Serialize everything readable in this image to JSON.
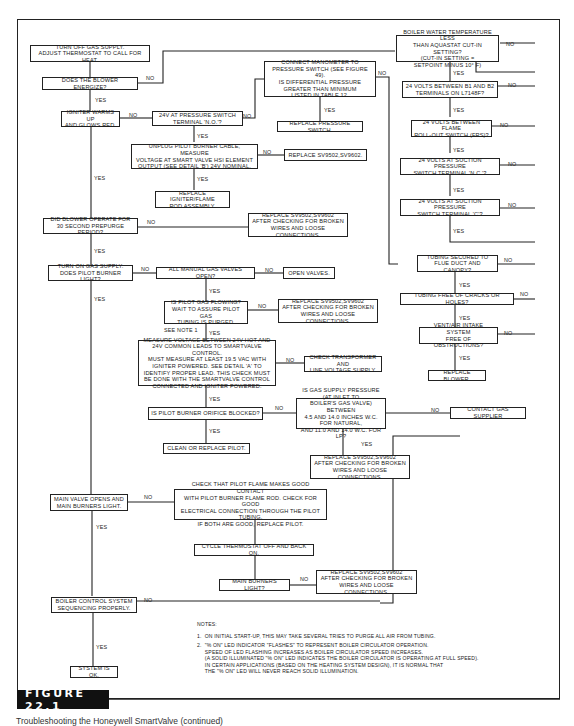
{
  "figure": {
    "label": "FIGURE 22.1",
    "caption": "Troubleshooting the Honeywell SmartValve (continued)"
  },
  "labels": {
    "yes": "YES",
    "no": "NO",
    "see_note_1": "SEE NOTE 1"
  },
  "boxes": {
    "turn_off_gas": "TURN OFF GAS SUPPLY.\nADJUST THERMOSTAT TO CALL FOR HEAT.",
    "blower_energize": "DOES THE BLOWER ENERGIZE?",
    "igniter_warms": "IGNITER WARMS UP\nAND GLOWS RED.",
    "v24_pressure_switch": "24V AT PRESSURE SWITCH\nTERMINAL 'N.O.'?",
    "connect_manometer": "CONNECT MANOMETER TO\nPRESSURE SWITCH (SEE FIGURE 49).\nIS DIFFERENTIAL PRESSURE\nGREATER THAN MINIMUM\nLISTED IN TABLE 12.",
    "replace_pressure_switch": "REPLACE PRESSURE SWITCH.",
    "unplug_pilot": "UNPLUG PILOT BURNER CABLE, MEASURE\nVOLTAGE AT SMART VALVE HSI ELEMENT\nOUTPUT (SEE DETAIL 'B') 24V NOMINAL.",
    "replace_sv_1": "REPLACE SV9502,SV9602.",
    "replace_igniter": "REPLACE IGNITER/FLAME\nROD ASSEMBLY.",
    "blower_prepurge": "DID BLOWER OPERATE FOR\n30 SECOND PREPURGE PERIOD?",
    "replace_sv_2": "REPLACE SV9502,SV9602\nAFTER CHECKING FOR BROKEN\nWIRES AND LOOSE CONNECTIONS.",
    "turn_on_gas": "TURN ON GAS SUPPLY.\nDOES PILOT BURNER LIGHT?",
    "manual_valves": "ALL MANUAL GAS VALVES OPEN?",
    "open_valves": "OPEN VALVES.",
    "pilot_gas_flowing": "IS PILOT GAS FLOWING?\nWAIT TO ASSURE PILOT GAS\nTUBING IS PURGED.",
    "replace_sv_3": "REPLACE SV9502,SV9602\nAFTER CHECKING FOR BROKEN\nWIRES AND LOOSE CONNECTIONS.",
    "measure_voltage": "MEASURE VOLTAGE BETWEEN 24V HOT AND\n24V COMMON LEADS TO SMARTVALVE CONTROL.\nMUST MEASURE AT LEAST 19.5 VAC WITH\nIGNITER POWERED. SEE DETAIL 'A' TO\nIDENTIFY PROPER LEAD. THIS CHECK MUST\nBE DONE WITH THE SMARTVALVE CONTROL\nCONNECTED AND IGNITER POWERED.",
    "check_transformer": "CHECK TRANSFORMER AND\nLINE VOLTAGE SUPPLY.",
    "orifice_blocked": "IS PILOT BURNER ORIFICE BLOCKED?",
    "gas_supply_pressure": "IS GAS SUPPLY PRESSURE (AT INLET TO\nBOILER'S GAS VALVE) BETWEEN\n4.5 AND 14.0 INCHES W.C. FOR NATURAL,\nAND 11.0 AND 14.0 W.C. FOR LP?",
    "contact_supplier": "CONTACT GAS SUPPLIER",
    "clean_pilot": "CLEAN OR REPLACE PILOT.",
    "replace_sv_4": "REPLACE SV9502,SV9602\nAFTER CHECKING FOR BROKEN\nWIRES AND LOOSE CONNECTIONS.",
    "main_valve_opens": "MAIN VALVE OPENS AND\nMAIN BURNERS LIGHT.",
    "check_pilot_flame": "CHECK THAT PILOT FLAME MAKES GOOD CONTACT\nWITH PILOT BURNER FLAME ROD. CHECK FOR GOOD\nELECTRICAL CONNECTION THROUGH THE PILOT TUBING.\nIF BOTH ARE GOOD, REPLACE PILOT.",
    "cycle_thermostat": "CYCLE THERMOSTAT OFF AND BACK ON.",
    "main_burners_light": "MAIN BURNERS LIGHT?",
    "replace_sv_5": "REPLACE SV9502,SV9602\nAFTER CHECKING FOR BROKEN\nWIRES AND LOOSE CONNECTIONS.",
    "boiler_sequencing": "BOILER CONTROL SYSTEM\nSEQUENCING PROPERLY.",
    "system_ok": "SYSTEM IS OK.",
    "boiler_water_temp": "BOILER WATER TEMPERATURE LESS\nTHAN AQUASTAT CUT-IN SETTING?\n(CUT-IN SETTING =\nSETPOINT MINUS 10° F)",
    "volts_b1_b2": "24 VOLTS BETWEEN B1 AND B2\nTERMINALS ON L7148F?",
    "volts_frs": "24 VOLTS BETWEEN FLAME\nROLL-OUT SWITCH (FRS)?",
    "volts_suction_nc": "24 VOLTS AT SUCTION PRESSURE\nSWITCH TERMINAL 'N.C.'?",
    "volts_suction_c": "24 VOLTS AT SUCTION PRESSURE\nSWITCH TERMINAL 'C'?",
    "tubing_secured": "TUBING SECURED TO\nFLUE DUCT AND CANOPY?",
    "tubing_free": "TUBING FREE OF CRACKS OR HOLES?",
    "vent_air": "VENT/AIR INTAKE SYSTEM\nFREE OF OBSTRUCTIONS?",
    "replace_blower": "REPLACE BLOWER."
  },
  "notes": {
    "title": "NOTES:",
    "note1": "1.  ON INITIAL START-UP, THIS MAY TAKE SEVERAL TRIES TO PURGE ALL AIR FROM TUBING.",
    "note2": "2.  \"% ON\" LED INDICATOR \"FLASHES\" TO REPRESENT BOILER CIRCULATOR OPERATION.\n     SPEED OF LED FLASHING INCREASES AS BOILER CIRCULATOR SPEED INCREASES.\n     (A SOLID ILLUMINATED \"% ON\" LED INDICATES THE BOILER CIRCULATOR IS OPERATING AT FULL SPEED).\n     IN CERTAIN APPLICATIONS (BASED ON THE HEATING SYSTEM DESIGN), IT IS NORMAL THAT\n     THE \"% ON\" LED WILL NEVER REACH SOLID ILLUMINATION."
  }
}
